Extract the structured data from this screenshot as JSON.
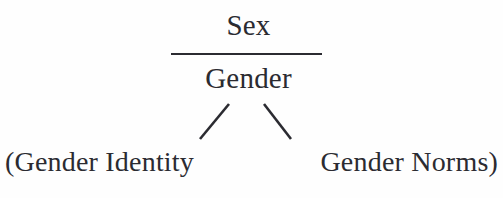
{
  "diagram": {
    "type": "tree-fraction-diagram",
    "background_color": "#fefefe",
    "text_color": "#2b2b31",
    "nodes": {
      "numerator": "Sex",
      "denominator": "Gender",
      "leaf_left": "(Gender Identity",
      "leaf_right": "Gender Norms)"
    },
    "connectors": {
      "fraction_bar": "horizontal-rule",
      "branch_left": "/",
      "branch_right": "\\"
    }
  }
}
